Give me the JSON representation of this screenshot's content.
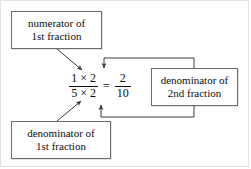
{
  "diagram": {
    "background_color": "#ffffff",
    "line_color": "#4a4a4a",
    "box_border_color": "#6b6b6b",
    "text_color": "#0d0d0d"
  },
  "equation": {
    "left_fraction": {
      "numerator": "1 × 2",
      "denominator": "5 × 2"
    },
    "equals": "=",
    "right_fraction": {
      "numerator": "2",
      "denominator": "10"
    },
    "plain_text": "1 × 2 / 5 × 2 = 2 / 10"
  },
  "callouts": [
    {
      "id": "numerator-1st",
      "line1": "numerator of",
      "line2": "1st fraction",
      "points_to": "left fraction numerator"
    },
    {
      "id": "denominator-1st",
      "line1": "denominator of",
      "line2": "1st fraction",
      "points_to": "left fraction denominator"
    },
    {
      "id": "denominator-2nd",
      "line1": "denominator of",
      "line2": "2nd fraction",
      "points_to": "left fraction numerator and denominator"
    }
  ],
  "connectors": [
    {
      "name": "numerator-1st-arrow",
      "kind": "diagonal-arrow",
      "from": "numerator of 1st fraction box",
      "to": "numerator 1 x 2"
    },
    {
      "name": "denominator-1st-arrow",
      "kind": "diagonal-arrow",
      "from": "denominator of 1st fraction box",
      "to": "denominator 5 x 2"
    },
    {
      "name": "denominator-2nd-top-arrow",
      "kind": "elbow-arrow",
      "from": "denominator of 2nd fraction box top",
      "to": "above numerator, pointing down"
    },
    {
      "name": "denominator-2nd-bottom-arrow",
      "kind": "elbow-arrow",
      "from": "denominator of 2nd fraction box bottom",
      "to": "below denominator, pointing up"
    }
  ]
}
